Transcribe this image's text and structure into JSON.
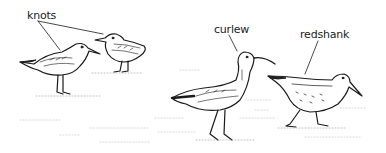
{
  "figure": {
    "type": "illustration",
    "background": "#ffffff",
    "ink": "#1a1a1a"
  },
  "labels": {
    "knots": "knots",
    "curlew": "curlew",
    "redshank": "redshank"
  },
  "birds": [
    {
      "name": "knot",
      "count": 2
    },
    {
      "name": "curlew",
      "count": 1
    },
    {
      "name": "redshank",
      "count": 1
    }
  ]
}
